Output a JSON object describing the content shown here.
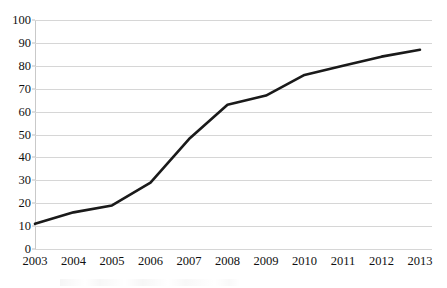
{
  "chart_data": {
    "type": "line",
    "title": "",
    "subtitle": "",
    "xlabel": "",
    "ylabel": "",
    "categories": [
      "2003",
      "2004",
      "2005",
      "2006",
      "2007",
      "2008",
      "2009",
      "2010",
      "2011",
      "2012",
      "2013"
    ],
    "values": [
      11,
      16,
      19,
      29,
      48,
      63,
      67,
      76,
      80,
      84,
      87
    ],
    "series": [
      {
        "name": "",
        "values": [
          11,
          16,
          19,
          29,
          48,
          63,
          67,
          76,
          80,
          84,
          87
        ],
        "color": "#1a1a1a"
      }
    ],
    "ylim": [
      0,
      100
    ],
    "y_ticks": [
      0,
      10,
      20,
      30,
      40,
      50,
      60,
      70,
      80,
      90,
      100
    ],
    "y_tick_labels": [
      "0",
      "10",
      "20",
      "30",
      "40",
      "50",
      "60",
      "70",
      "80",
      "90",
      "100"
    ],
    "grid": true,
    "grid_axis": "y",
    "grid_color": "#d6d6d6",
    "legend": false,
    "legend_position": "none",
    "markers": false,
    "line_width": 2.6,
    "background_color": "#ffffff",
    "axis_color": "#c9c9c9",
    "text_color": "#101010",
    "annotations": []
  }
}
